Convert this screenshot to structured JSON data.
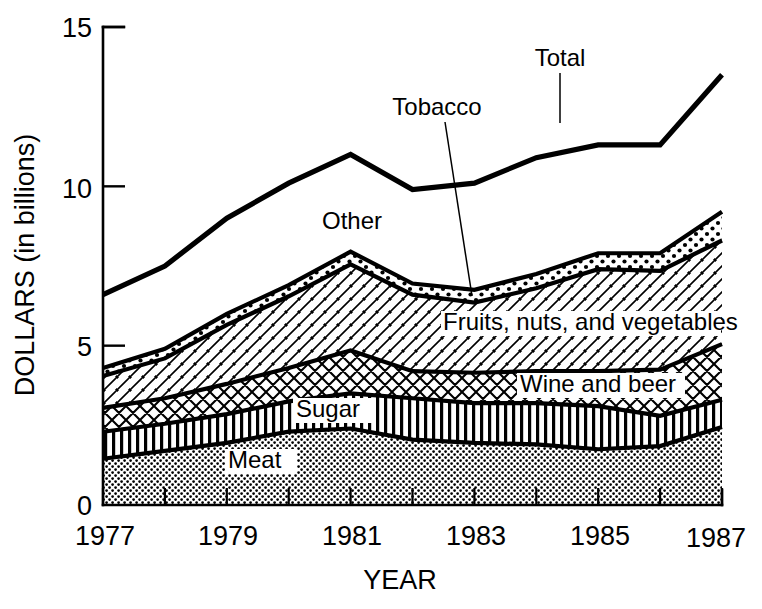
{
  "chart_data": {
    "type": "area",
    "title": "",
    "xlabel": "YEAR",
    "ylabel": "DOLLARS (in billions)",
    "x": [
      1977,
      1978,
      1979,
      1980,
      1981,
      1982,
      1983,
      1984,
      1985,
      1986,
      1987
    ],
    "xlim": [
      1977,
      1987
    ],
    "ylim": [
      0,
      15
    ],
    "yticks": [
      0,
      5,
      10,
      15
    ],
    "ytick_labels": [
      "0",
      "5",
      "10",
      "15"
    ],
    "xticks": [
      1977,
      1978,
      1979,
      1980,
      1981,
      1982,
      1983,
      1984,
      1985,
      1986,
      1987
    ],
    "xtick_labels": [
      "1977",
      "",
      "1979",
      "",
      "1981",
      "",
      "1983",
      "",
      "1985",
      "",
      "1987"
    ],
    "grid": false,
    "legend_position": "inline-annotations",
    "stacked": true,
    "series": [
      {
        "name": "Meat",
        "pattern": "fine-dots",
        "values": [
          1.45,
          1.7,
          1.95,
          2.3,
          2.4,
          2.05,
          1.95,
          1.9,
          1.75,
          1.85,
          2.45
        ]
      },
      {
        "name": "Sugar",
        "pattern": "vertical-stripes",
        "values": [
          0.85,
          0.85,
          0.9,
          0.95,
          1.1,
          1.3,
          1.25,
          1.3,
          1.35,
          0.95,
          0.85
        ]
      },
      {
        "name": "Wine and beer",
        "pattern": "diamond-crosshatch",
        "values": [
          0.75,
          0.8,
          0.95,
          1.05,
          1.35,
          0.85,
          0.95,
          1.0,
          1.1,
          1.45,
          1.75
        ]
      },
      {
        "name": "Fruits, nuts, and vegetables",
        "pattern": "diagonal-hatch",
        "values": [
          1.0,
          1.25,
          1.85,
          2.25,
          2.7,
          2.4,
          2.2,
          2.6,
          3.2,
          3.1,
          3.25
        ]
      },
      {
        "name": "Tobacco",
        "pattern": "coarse-dots",
        "values": [
          0.25,
          0.3,
          0.35,
          0.35,
          0.4,
          0.35,
          0.4,
          0.45,
          0.5,
          0.55,
          0.9
        ]
      },
      {
        "name": "Other",
        "pattern": "none",
        "values": [
          2.3,
          2.6,
          3.0,
          3.2,
          3.05,
          2.95,
          3.35,
          3.65,
          3.4,
          3.4,
          4.3
        ]
      }
    ],
    "total": {
      "name": "Total",
      "values": [
        6.6,
        7.5,
        9.0,
        10.1,
        11.0,
        9.9,
        10.1,
        10.9,
        11.3,
        11.3,
        13.5
      ]
    },
    "annotations": [
      {
        "text": "Total",
        "x": 1984.1,
        "y": 13.7,
        "leader": true
      },
      {
        "text": "Tobacco",
        "x": 1981.7,
        "y": 12.4,
        "leader": true
      },
      {
        "text": "Other",
        "x": 1980.3,
        "y": 8.6,
        "leader": false
      },
      {
        "text": "Fruits, nuts, and vegetables",
        "x": 1983.5,
        "y": 5.6,
        "leader": false
      },
      {
        "text": "Wine and beer",
        "x": 1984.6,
        "y": 3.7,
        "leader": false
      },
      {
        "text": "Sugar",
        "x": 1981.0,
        "y": 3.0,
        "leader": false
      },
      {
        "text": "Meat",
        "x": 1980.2,
        "y": 1.3,
        "leader": false
      }
    ]
  },
  "axes": {
    "y_title": "DOLLARS (in billions)",
    "x_title": "YEAR",
    "y_tick_15": "15",
    "y_tick_10": "10",
    "y_tick_5": "5",
    "y_tick_0": "0",
    "x_tick_1977": "1977",
    "x_tick_1979": "1979",
    "x_tick_1981": "1981",
    "x_tick_1983": "1983",
    "x_tick_1985": "1985",
    "x_tick_1987": "1987"
  },
  "labels": {
    "total": "Total",
    "tobacco": "Tobacco",
    "other": "Other",
    "fruits": "Fruits, nuts, and vegetables",
    "wine": "Wine and beer",
    "sugar": "Sugar",
    "meat": "Meat"
  },
  "colors": {
    "ink": "#000000",
    "paper": "#ffffff"
  }
}
